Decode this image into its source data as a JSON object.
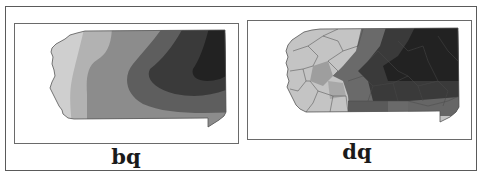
{
  "figure": {
    "panels": [
      {
        "id": "bq",
        "label": "bq",
        "description": "Smoothed contour map of Pennsylvania, light in west grading to dark in east"
      },
      {
        "id": "dq",
        "label": "dq",
        "description": "County-level choropleth map of Pennsylvania, light in west grading to dark in east"
      }
    ],
    "colors": {
      "level1": "#cfcfcf",
      "level2": "#b2b2b2",
      "level3": "#8c8c8c",
      "level4": "#5e5e5e",
      "level5": "#3a3a3a",
      "level6": "#222222",
      "border": "#555555"
    }
  }
}
